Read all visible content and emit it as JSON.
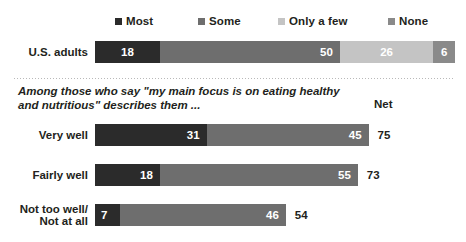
{
  "legend": {
    "items": [
      {
        "label": "Most",
        "color": "#2b2b2b"
      },
      {
        "label": "Some",
        "color": "#6e6e6e"
      },
      {
        "label": "Only a few",
        "color": "#c4c4c4"
      },
      {
        "label": "None",
        "color": "#8a8a8a"
      }
    ]
  },
  "subtitle": {
    "line1": "Among those who say \"my main focus is on eating healthy",
    "line2": "and nutritious\" describes them ..."
  },
  "net_header": "Net",
  "top_row": {
    "label": "U.S. adults",
    "values": [
      18,
      50,
      26,
      6
    ],
    "value_labels": [
      "18",
      "50",
      "26",
      "6"
    ]
  },
  "group_rows": [
    {
      "label": "Very well",
      "label_line1": "Very well",
      "label_line2": "",
      "values": [
        31,
        45
      ],
      "value_labels": [
        "31",
        "45"
      ],
      "net": "75"
    },
    {
      "label": "Fairly well",
      "label_line1": "Fairly well",
      "label_line2": "",
      "values": [
        18,
        55
      ],
      "value_labels": [
        "18",
        "55"
      ],
      "net": "73"
    },
    {
      "label": "Not too well/ Not at all",
      "label_line1": "Not too well/",
      "label_line2": "Not at all",
      "values": [
        7,
        46
      ],
      "value_labels": [
        "7",
        "46"
      ],
      "net": "54"
    }
  ],
  "chart_data": {
    "type": "bar",
    "title": "",
    "subtitle": "Among those who say \"my main focus is on eating healthy and nutritious\" describes them ...",
    "orientation": "horizontal",
    "stacked": true,
    "xlabel": "",
    "ylabel": "",
    "xlim": [
      0,
      100
    ],
    "grid": false,
    "legend_position": "top",
    "legend_entries": [
      "Most",
      "Some",
      "Only a few",
      "None"
    ],
    "colors": [
      "#2b2b2b",
      "#6e6e6e",
      "#c4c4c4",
      "#8a8a8a"
    ],
    "panels": [
      {
        "name": "All adults",
        "categories": [
          "U.S. adults"
        ],
        "series": [
          {
            "name": "Most",
            "values": [
              18
            ]
          },
          {
            "name": "Some",
            "values": [
              50
            ]
          },
          {
            "name": "Only a few",
            "values": [
              26
            ]
          },
          {
            "name": "None",
            "values": [
              6
            ]
          }
        ]
      },
      {
        "name": "Among those who say \"my main focus is on eating healthy and nutritious\" describes them ...",
        "categories": [
          "Very well",
          "Fairly well",
          "Not too well/Not at all"
        ],
        "series": [
          {
            "name": "Most",
            "values": [
              31,
              18,
              7
            ]
          },
          {
            "name": "Some",
            "values": [
              45,
              55,
              46
            ]
          }
        ],
        "net": {
          "label": "Net",
          "values": [
            75,
            73,
            54
          ]
        }
      }
    ]
  }
}
